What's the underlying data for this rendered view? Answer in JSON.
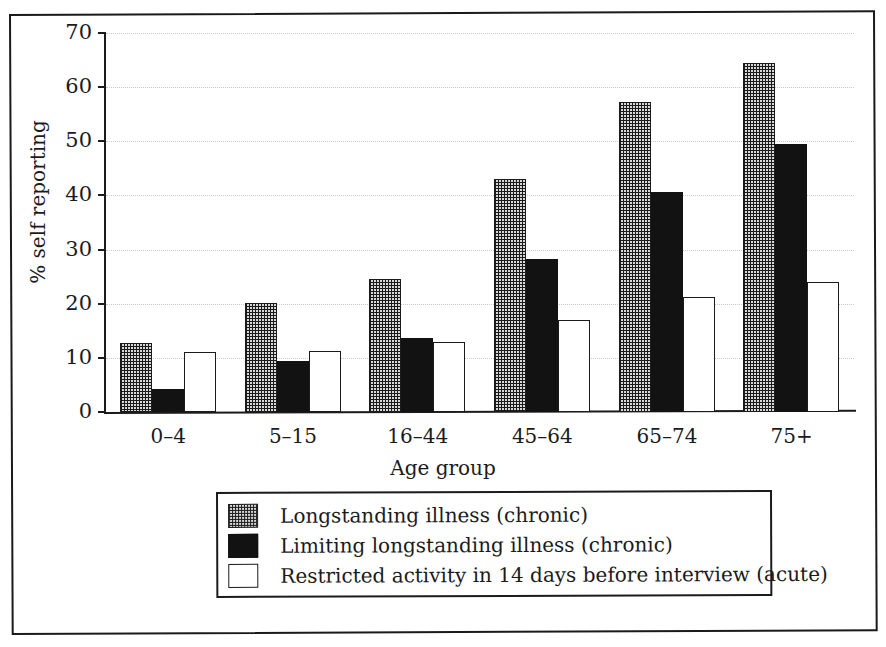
{
  "chart_data": {
    "type": "bar",
    "title": "",
    "xlabel": "Age group",
    "ylabel": "% self reporting",
    "categories": [
      "0–4",
      "5–15",
      "16–44",
      "45–64",
      "65–74",
      "75+"
    ],
    "series": [
      {
        "name": "Longstanding illness (chronic)",
        "pattern": "checkered",
        "values": [
          12.8,
          20.2,
          24.5,
          43.0,
          57.3,
          64.5
        ]
      },
      {
        "name": "Limiting longstanding illness (chronic)",
        "pattern": "solid-black",
        "values": [
          4.3,
          9.5,
          13.7,
          28.2,
          40.7,
          49.5
        ]
      },
      {
        "name": "Restricted activity in 14 days before interview (acute)",
        "pattern": "white-outline",
        "values": [
          11.0,
          11.2,
          13.0,
          17.0,
          21.3,
          24.0
        ]
      }
    ],
    "ylim": [
      0,
      70
    ],
    "yticks": [
      0,
      10,
      20,
      30,
      40,
      50,
      60,
      70
    ],
    "ytick_labels": [
      "0",
      "10",
      "20",
      "30",
      "40",
      "50",
      "60",
      "70"
    ],
    "grid": true,
    "grid_axis": "y",
    "legend_position": "below-axes",
    "colors": {
      "axis": "#1b1b1b",
      "grid": "#c9c9c9",
      "series0": "#d8d8d8",
      "series1": "#121212",
      "series2": "#ffffff",
      "background": "#ffffff"
    }
  },
  "axes": {
    "y_title": "% self reporting",
    "x_title": "Age group"
  }
}
